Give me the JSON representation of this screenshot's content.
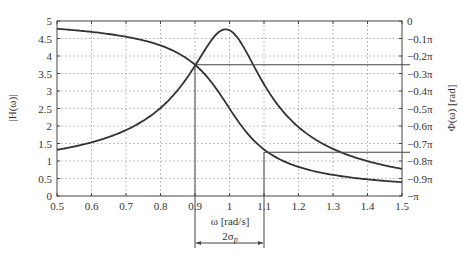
{
  "chart_data": {
    "type": "line",
    "title": "",
    "xlabel": "ω [rad/s]",
    "ylabel": "|H(ω)|",
    "ylabel_right": "Φ(ω) [rad]",
    "xlim": [
      0.5,
      1.5
    ],
    "ylim": [
      0,
      5
    ],
    "ylim_right": [
      "-π",
      "0"
    ],
    "grid": true,
    "grid_style": "dotted",
    "x_ticks": [
      "0.5",
      "0.6",
      "0.7",
      "0.8",
      "0.9",
      "1",
      "1.1",
      "1.2",
      "1.3",
      "1.4",
      "1.5"
    ],
    "y_ticks": [
      "0",
      "0.5",
      "1",
      "1.5",
      "2",
      "2.5",
      "3",
      "3.5",
      "4",
      "4.5",
      "5"
    ],
    "y_ticks_right": [
      "0",
      "−0.1π",
      "−0.2π",
      "−0.3π",
      "−0.4π",
      "−0.5π",
      "−0.6π",
      "−0.7π",
      "−0.8π",
      "−0.9π",
      "−π"
    ],
    "x": [
      0.5,
      0.6,
      0.7,
      0.8,
      0.9,
      0.95,
      1.0,
      1.05,
      1.1,
      1.2,
      1.3,
      1.4,
      1.5
    ],
    "series": [
      {
        "name": "|H(ω)|",
        "axis": "left",
        "values": [
          1.32,
          1.53,
          1.89,
          2.6,
          3.54,
          4.36,
          4.73,
          4.29,
          3.31,
          2.04,
          1.35,
          0.98,
          0.78
        ]
      },
      {
        "name": "Φ(ω)",
        "axis": "right",
        "unit": "π rad",
        "values": [
          -0.045,
          -0.058,
          -0.083,
          -0.138,
          -0.25,
          -0.377,
          -0.5,
          -0.631,
          -0.75,
          -0.873,
          -0.918,
          -0.939,
          -0.951
        ]
      }
    ],
    "annotations": [
      {
        "type": "hline",
        "at_right": "-0.25π",
        "from_x": 0.9
      },
      {
        "type": "hline",
        "at_right": "-0.75π",
        "from_x": 1.1
      },
      {
        "type": "vline",
        "x": 0.9,
        "label": ""
      },
      {
        "type": "vline",
        "x": 1.1,
        "label": ""
      },
      {
        "type": "double-arrow",
        "from_x": 0.9,
        "to_x": 1.1,
        "label": "2σp"
      }
    ],
    "params": {
      "zeta": 0.1056,
      "omega0": 1
    }
  },
  "labels": {
    "xlabel": "ω [rad/s]",
    "ylabel": "|H(ω)|",
    "ylabel_right": "Φ(ω) [rad]",
    "bandwidth": "2σ",
    "bandwidth_sub": "p"
  }
}
